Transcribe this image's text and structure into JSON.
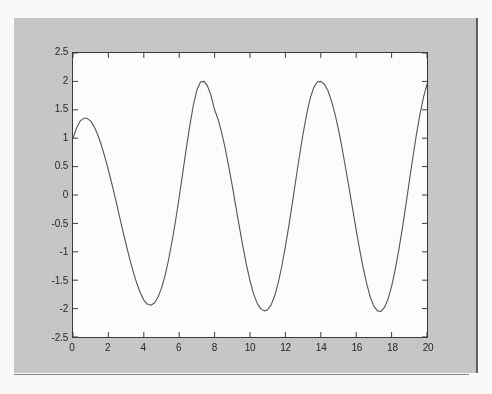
{
  "figure": {
    "window_background": "#c8c8c8",
    "axes_background": "#fefefe",
    "line_color": "#555555"
  },
  "chart_data": {
    "type": "line",
    "title": "",
    "xlabel": "",
    "ylabel": "",
    "xlim": [
      0,
      20
    ],
    "ylim": [
      -2.5,
      2.5
    ],
    "grid": false,
    "legend": null,
    "xticks": [
      0,
      2,
      4,
      6,
      8,
      10,
      12,
      14,
      16,
      18,
      20
    ],
    "xticklabels": [
      "0",
      "2",
      "4",
      "6",
      "8",
      "10",
      "12",
      "14",
      "16",
      "18",
      "20"
    ],
    "yticks": [
      -2.5,
      -2,
      -1.5,
      -1,
      -0.5,
      0,
      0.5,
      1,
      1.5,
      2,
      2.5
    ],
    "yticklabels": [
      "-2.5",
      "-2",
      "-1.5",
      "-1",
      "-0.5",
      "0",
      "0.5",
      "1",
      "1.5",
      "2",
      "2.5"
    ],
    "series": [
      {
        "name": "signal",
        "color": "#555555",
        "x": [
          0,
          0.2,
          0.4,
          0.6,
          0.8,
          1.0,
          1.2,
          1.4,
          1.6,
          1.8,
          2.0,
          2.2,
          2.4,
          2.6,
          2.8,
          3.0,
          3.2,
          3.4,
          3.6,
          3.8,
          4.0,
          4.2,
          4.4,
          4.6,
          4.8,
          5.0,
          5.2,
          5.4,
          5.6,
          5.8,
          6.0,
          6.2,
          6.4,
          6.6,
          6.8,
          7.0,
          7.2,
          7.4,
          7.6,
          7.8,
          8.0,
          8.2,
          8.4,
          8.6,
          8.8,
          9.0,
          9.2,
          9.4,
          9.6,
          9.8,
          10.0,
          10.2,
          10.4,
          10.6,
          10.8,
          11.0,
          11.2,
          11.4,
          11.6,
          11.8,
          12.0,
          12.2,
          12.4,
          12.6,
          12.8,
          13.0,
          13.2,
          13.4,
          13.6,
          13.8,
          14.0,
          14.2,
          14.4,
          14.6,
          14.8,
          15.0,
          15.2,
          15.4,
          15.6,
          15.8,
          16.0,
          16.2,
          16.4,
          16.6,
          16.8,
          17.0,
          17.2,
          17.4,
          17.6,
          17.8,
          18.0,
          18.2,
          18.4,
          18.6,
          18.8,
          19.0,
          19.2,
          19.4,
          19.6,
          19.8,
          20.0
        ],
        "y": [
          1.0,
          1.18,
          1.3,
          1.35,
          1.35,
          1.3,
          1.2,
          1.06,
          0.88,
          0.67,
          0.44,
          0.19,
          -0.07,
          -0.34,
          -0.61,
          -0.87,
          -1.12,
          -1.35,
          -1.55,
          -1.72,
          -1.85,
          -1.92,
          -1.94,
          -1.9,
          -1.8,
          -1.64,
          -1.42,
          -1.14,
          -0.81,
          -0.44,
          -0.04,
          0.39,
          0.82,
          1.22,
          1.58,
          1.85,
          1.99,
          2.0,
          1.92,
          1.75,
          1.5,
          1.33,
          1.1,
          0.82,
          0.5,
          0.16,
          -0.2,
          -0.56,
          -0.91,
          -1.23,
          -1.51,
          -1.74,
          -1.9,
          -2.0,
          -2.04,
          -2.02,
          -1.93,
          -1.77,
          -1.54,
          -1.25,
          -0.91,
          -0.53,
          -0.13,
          0.29,
          0.7,
          1.08,
          1.42,
          1.7,
          1.89,
          1.99,
          2.0,
          1.95,
          1.84,
          1.66,
          1.43,
          1.15,
          0.83,
          0.48,
          0.12,
          -0.25,
          -0.62,
          -0.97,
          -1.29,
          -1.57,
          -1.8,
          -1.96,
          -2.04,
          -2.05,
          -1.98,
          -1.83,
          -1.61,
          -1.32,
          -0.98,
          -0.6,
          -0.19,
          0.24,
          0.66,
          1.06,
          1.42,
          1.72,
          1.95
        ]
      }
    ]
  },
  "ticks": {
    "direction": "in",
    "sides": [
      "left",
      "bottom",
      "top",
      "right"
    ]
  }
}
